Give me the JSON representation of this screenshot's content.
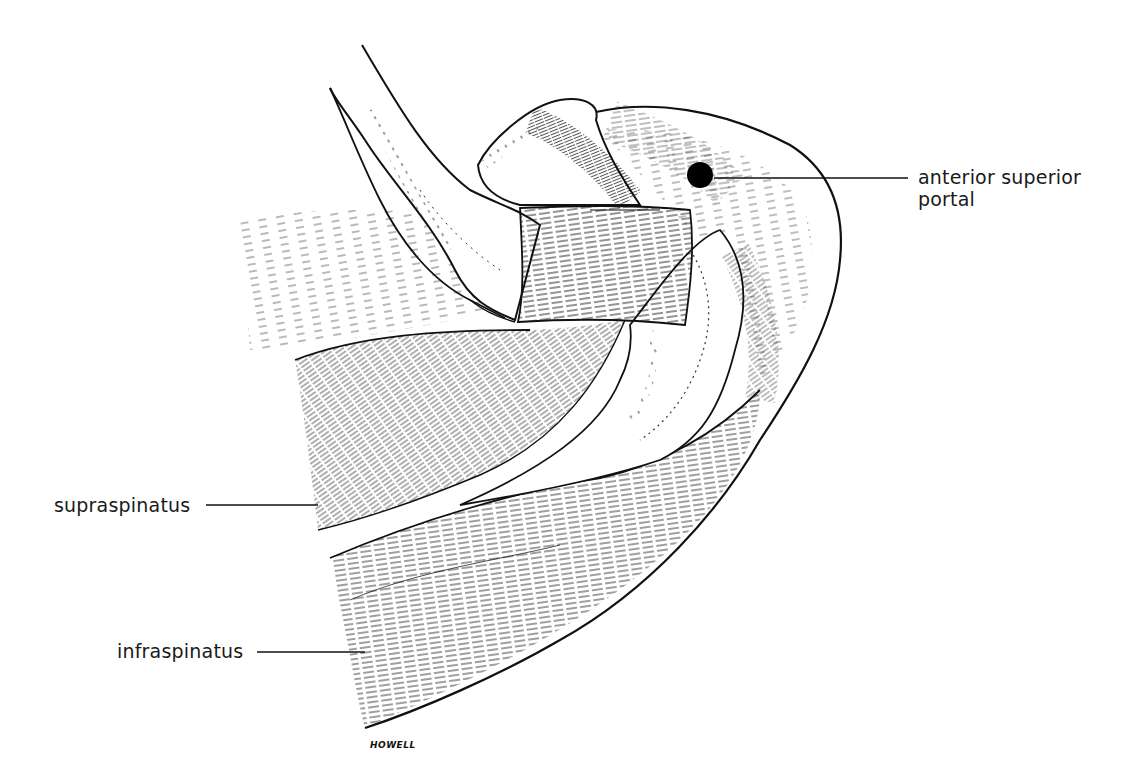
{
  "figure": {
    "background": "#ffffff",
    "ink": "#111111",
    "signature": "HOWELL",
    "labels": [
      {
        "id": "anterior-superior-portal",
        "lines": [
          "anterior superior",
          "portal"
        ],
        "x": 918,
        "y": 166,
        "leader": {
          "x1": 714,
          "y1": 178,
          "x2": 908,
          "y2": 178
        }
      },
      {
        "id": "supraspinatus",
        "lines": [
          "supraspinatus"
        ],
        "x": 54,
        "y": 494,
        "leader": {
          "x1": 206,
          "y1": 505,
          "x2": 318,
          "y2": 505
        }
      },
      {
        "id": "infraspinatus",
        "lines": [
          "infraspinatus"
        ],
        "x": 117,
        "y": 640,
        "leader": {
          "x1": 257,
          "y1": 652,
          "x2": 365,
          "y2": 652
        }
      }
    ],
    "portal_marker": {
      "cx": 700,
      "cy": 175,
      "r": 13,
      "color": "#000000"
    }
  }
}
